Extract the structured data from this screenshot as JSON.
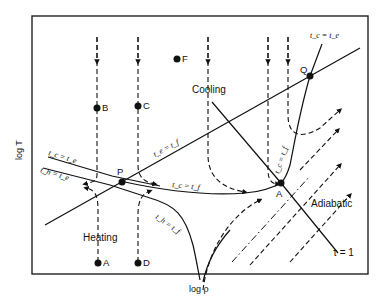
{
  "figure": {
    "type": "phase-diagram",
    "axes": {
      "x_label": "log ρ",
      "y_label": "log T"
    },
    "points": [
      {
        "id": "A",
        "label": "A"
      },
      {
        "id": "B",
        "label": "B"
      },
      {
        "id": "C",
        "label": "C"
      },
      {
        "id": "D",
        "label": "D"
      },
      {
        "id": "F",
        "label": "F"
      },
      {
        "id": "P",
        "label": "P"
      },
      {
        "id": "Q",
        "label": "Q"
      },
      {
        "id": "A_eq",
        "label": "A"
      }
    ],
    "regions": {
      "cooling": "Cooling",
      "heating": "Heating",
      "adiabatic": "Adiabatic"
    },
    "curves": {
      "tc_te_top": "t_c = t_e",
      "tc_te_left": "t_c = t_e",
      "th_te_left": "t_h = t_e",
      "te_tf": "t_e = t_f",
      "tc_tf_mid": "t_c = t_f",
      "tc_tf_right": "t_c = t_f",
      "th_tf": "t_h = t_f",
      "tau1": "τ = 1"
    }
  }
}
